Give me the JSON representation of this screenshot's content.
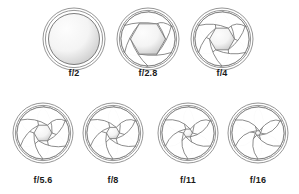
{
  "figure": {
    "background_color": "#ffffff",
    "stroke_color": "#6e6e6e",
    "outer_ring_color": "#8a8a8a",
    "blade_fill": "#ffffff",
    "opening_fill_light": "#f4f4f4",
    "opening_fill_dark": "#c9c9c9",
    "label_color": "#1a1a1a",
    "blade_count": 6
  },
  "rows": [
    {
      "name": "top-row",
      "cells": [
        {
          "label": "f/2",
          "fstop": 2,
          "center_x": 74,
          "center_y": 39,
          "outer_radius": 31,
          "inner_radius": 27,
          "opening_radius": 25.5,
          "opening_shape": "circle",
          "blade_travel": 0.0,
          "label_x": 74,
          "label_y": 74
        },
        {
          "label": "f/2.8",
          "fstop": 2.8,
          "center_x": 148,
          "center_y": 39,
          "outer_radius": 31,
          "inner_radius": 27,
          "opening_radius": 17.5,
          "opening_shape": "hexagon",
          "blade_travel": 0.33,
          "label_x": 148,
          "label_y": 74
        },
        {
          "label": "f/4",
          "fstop": 4,
          "center_x": 222,
          "center_y": 39,
          "outer_radius": 31,
          "inner_radius": 27,
          "opening_radius": 12.5,
          "opening_shape": "hexagon",
          "blade_travel": 0.52,
          "label_x": 222,
          "label_y": 74
        }
      ]
    },
    {
      "name": "bottom-row",
      "cells": [
        {
          "label": "f/5.6",
          "fstop": 5.6,
          "center_x": 43,
          "center_y": 133,
          "outer_radius": 30,
          "inner_radius": 26,
          "opening_radius": 9.0,
          "opening_shape": "hexagon",
          "blade_travel": 0.66,
          "label_x": 43,
          "label_y": 181
        },
        {
          "label": "f/8",
          "fstop": 8,
          "center_x": 113,
          "center_y": 133,
          "outer_radius": 30,
          "inner_radius": 26,
          "opening_radius": 6.5,
          "opening_shape": "hexagon",
          "blade_travel": 0.76,
          "label_x": 113,
          "label_y": 181
        },
        {
          "label": "f/11",
          "fstop": 11,
          "center_x": 188,
          "center_y": 133,
          "outer_radius": 30,
          "inner_radius": 26,
          "opening_radius": 4.5,
          "opening_shape": "hexagon",
          "blade_travel": 0.84,
          "label_x": 188,
          "label_y": 181
        },
        {
          "label": "f/16",
          "fstop": 16,
          "center_x": 258,
          "center_y": 133,
          "outer_radius": 30,
          "inner_radius": 26,
          "opening_radius": 2.6,
          "opening_shape": "hexagon",
          "blade_travel": 0.92,
          "label_x": 258,
          "label_y": 181
        }
      ]
    }
  ]
}
